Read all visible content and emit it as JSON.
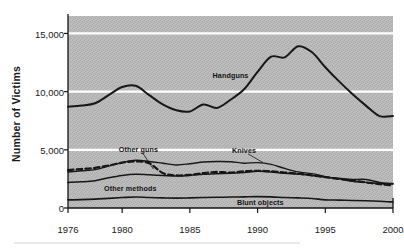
{
  "chart_data": {
    "type": "line",
    "title": "",
    "xlabel": "",
    "ylabel": "Number of Victims",
    "xlim": [
      1976,
      2000
    ],
    "ylim": [
      0,
      16500
    ],
    "y_gridlines": [
      5000,
      10000,
      15000
    ],
    "grid": true,
    "grid_color": "#ffffff",
    "plot_background": "#b9b9b9",
    "legend_position": "inline-annotations",
    "ytick_labels": [
      "0",
      "5,000",
      "10,000",
      "15,000"
    ],
    "ytick_values": [
      0,
      5000,
      10000,
      15000
    ],
    "xtick_labels": [
      "1976",
      "1980",
      "1985",
      "1990",
      "1995",
      "2000"
    ],
    "xtick_values": [
      1976,
      1980,
      1985,
      1990,
      1995,
      2000
    ],
    "x": [
      1976,
      1977,
      1978,
      1979,
      1980,
      1981,
      1982,
      1983,
      1984,
      1985,
      1986,
      1987,
      1988,
      1989,
      1990,
      1991,
      1992,
      1993,
      1994,
      1995,
      1996,
      1997,
      1998,
      1999,
      2000
    ],
    "series": [
      {
        "name": "Handguns",
        "style": "solid",
        "color": "#171717",
        "width": 2.0,
        "label_x": 1988.0,
        "label_y": 11400,
        "leader": false,
        "values": [
          8700,
          8800,
          9000,
          9700,
          10400,
          10500,
          9700,
          8900,
          8400,
          8300,
          8900,
          8600,
          9300,
          10200,
          11700,
          13000,
          12950,
          13900,
          13400,
          12100,
          10900,
          9800,
          8800,
          7900,
          7900
        ]
      },
      {
        "name": "Knives",
        "style": "solid",
        "color": "#171717",
        "width": 1.4,
        "label_x": 1989.0,
        "label_y": 5000,
        "leader": true,
        "leader_to_x": 1990.4,
        "leader_to_y": 3900,
        "values": [
          3100,
          3200,
          3300,
          3600,
          3900,
          4100,
          4000,
          3850,
          3700,
          3800,
          3950,
          4000,
          3980,
          3850,
          3900,
          3750,
          3400,
          3100,
          2950,
          2700,
          2500,
          2300,
          2200,
          2100,
          2050
        ]
      },
      {
        "name": "Other guns",
        "style": "dashed",
        "color": "#171717",
        "width": 2.2,
        "label_x": 1981.2,
        "label_y": 5100,
        "leader": true,
        "leader_to_x": 1982.3,
        "leader_to_y": 3350,
        "values": [
          3250,
          3350,
          3450,
          3650,
          3900,
          4000,
          3850,
          3000,
          2800,
          2850,
          3000,
          3100,
          3050,
          3150,
          3200,
          3150,
          3050,
          2950,
          2800,
          2650,
          2500,
          2350,
          2200,
          2050,
          1950
        ]
      },
      {
        "name": "Other methods",
        "style": "solid",
        "color": "#171717",
        "width": 1.5,
        "label_x": 1980.6,
        "label_y": 1750,
        "leader": false,
        "values": [
          2200,
          2250,
          2350,
          2600,
          2800,
          2900,
          2850,
          2800,
          2750,
          2800,
          2900,
          2950,
          2980,
          3050,
          3150,
          3100,
          2980,
          2900,
          2800,
          2650,
          2550,
          2450,
          2450,
          2200,
          2100
        ]
      },
      {
        "name": "Blunt objects",
        "style": "solid",
        "color": "#171717",
        "width": 1.6,
        "label_x": 1990.2,
        "label_y": 480,
        "leader": false,
        "values": [
          700,
          720,
          760,
          830,
          900,
          950,
          900,
          870,
          850,
          870,
          900,
          920,
          940,
          960,
          980,
          960,
          900,
          870,
          820,
          700,
          680,
          650,
          620,
          580,
          520
        ]
      }
    ]
  }
}
